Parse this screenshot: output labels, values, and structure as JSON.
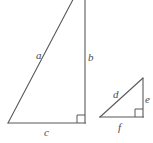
{
  "figure": {
    "kind": "geometry-diagram",
    "background_color": "#ffffff",
    "stroke_color": "#595959",
    "label_color": "#4a4a4a",
    "stroke_width": 1,
    "shapes": [
      {
        "name": "large-right-triangle",
        "vertices": [
          {
            "name": "apex",
            "x": 78,
            "y": -10
          },
          {
            "name": "right-angle-vertex",
            "x": 85,
            "y": 123
          },
          {
            "name": "left-vertex",
            "x": 8,
            "y": 123
          }
        ],
        "right_angle_marker": {
          "at_vertex": "right-angle-vertex",
          "x": 77,
          "y": 115,
          "size": 8
        },
        "sides": [
          {
            "label": "a",
            "role": "hypotenuse",
            "from": "left-vertex",
            "to": "apex"
          },
          {
            "label": "b",
            "role": "vertical-leg",
            "from": "apex",
            "to": "right-angle-vertex"
          },
          {
            "label": "c",
            "role": "horizontal-leg",
            "from": "left-vertex",
            "to": "right-angle-vertex"
          }
        ]
      },
      {
        "name": "small-right-triangle",
        "vertices": [
          {
            "name": "apex",
            "x": 143,
            "y": 78
          },
          {
            "name": "right-angle-vertex",
            "x": 143,
            "y": 117
          },
          {
            "name": "left-vertex",
            "x": 100,
            "y": 117
          }
        ],
        "right_angle_marker": {
          "at_vertex": "right-angle-vertex",
          "x": 135,
          "y": 109,
          "size": 8
        },
        "sides": [
          {
            "label": "d",
            "role": "hypotenuse",
            "from": "left-vertex",
            "to": "apex"
          },
          {
            "label": "e",
            "role": "vertical-leg",
            "from": "apex",
            "to": "right-angle-vertex"
          },
          {
            "label": "f",
            "role": "horizontal-leg",
            "from": "left-vertex",
            "to": "right-angle-vertex"
          }
        ]
      }
    ],
    "labels": {
      "a": "a",
      "b": "b",
      "c": "c",
      "d": "d",
      "e": "e",
      "f": "f"
    }
  }
}
